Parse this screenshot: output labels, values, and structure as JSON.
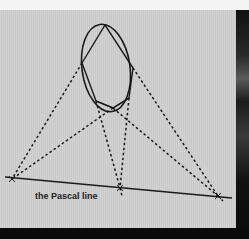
{
  "image": {
    "description": "Photograph of a printed geometry diagram illustrating Pascal's theorem: a hexagon inscribed in an ellipse with extended sides meeting on a straight line",
    "caption_label": "the Pascal line",
    "colors": {
      "paper": "#cfcfcf",
      "ink": "#1a1a1a",
      "background_dark": "#0b0b0b",
      "top_strip": "#f4f4f4"
    }
  },
  "diagram": {
    "ellipse": {
      "cx": 106,
      "cy": 68,
      "rx": 24,
      "ry": 44
    },
    "hexagon_points": [
      [
        105,
        25
      ],
      [
        82,
        63
      ],
      [
        96,
        101
      ],
      [
        113,
        108
      ],
      [
        129,
        98
      ],
      [
        133,
        68
      ]
    ],
    "pascal_line": {
      "x1": 5,
      "y1": 177,
      "x2": 232,
      "y2": 198
    },
    "intersections": [
      [
        12,
        179
      ],
      [
        120,
        188
      ],
      [
        218,
        196
      ]
    ]
  }
}
